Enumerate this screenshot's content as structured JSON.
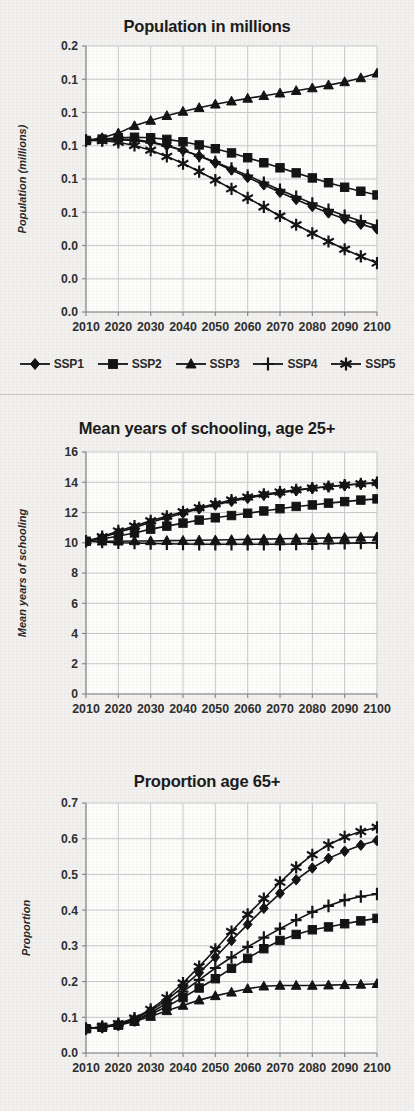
{
  "figure": {
    "divider_count": 2
  },
  "legend": {
    "items": [
      {
        "label": "SSP1",
        "marker": "diamond"
      },
      {
        "label": "SSP2",
        "marker": "square"
      },
      {
        "label": "SSP3",
        "marker": "triangle"
      },
      {
        "label": "SSP4",
        "marker": "plus"
      },
      {
        "label": "SSP5",
        "marker": "asterisk"
      }
    ]
  },
  "chart_data": [
    {
      "id": "population",
      "type": "line",
      "title": "Population in millions",
      "xlabel": "",
      "ylabel": "Population (millions)",
      "x": [
        2010,
        2015,
        2020,
        2025,
        2030,
        2035,
        2040,
        2045,
        2050,
        2055,
        2060,
        2065,
        2070,
        2075,
        2080,
        2085,
        2090,
        2095,
        2100
      ],
      "xtick_labels": [
        "2010",
        "2020",
        "2030",
        "2040",
        "2050",
        "2060",
        "2070",
        "2080",
        "2090",
        "2100"
      ],
      "xlim": [
        2010,
        2100
      ],
      "ytick_labels": [
        "0.2",
        "0.1",
        "0.1",
        "0.1",
        "0.1",
        "0.1",
        "0.0",
        "0.0",
        "0.0"
      ],
      "ytick_values": [
        0.2,
        0.175,
        0.15,
        0.125,
        0.1,
        0.075,
        0.05,
        0.025,
        0.0
      ],
      "ylim": [
        0.0,
        0.2
      ],
      "grid": true,
      "legend_position": "below",
      "series": [
        {
          "name": "SSP1",
          "marker": "diamond",
          "values": [
            0.129,
            0.1296,
            0.13,
            0.1297,
            0.128,
            0.1252,
            0.1216,
            0.1172,
            0.1122,
            0.1068,
            0.1012,
            0.0956,
            0.09,
            0.0846,
            0.0794,
            0.0745,
            0.07,
            0.066,
            0.0625
          ]
        },
        {
          "name": "SSP2",
          "marker": "square",
          "values": [
            0.129,
            0.13,
            0.131,
            0.1314,
            0.131,
            0.1298,
            0.128,
            0.1256,
            0.1228,
            0.1196,
            0.116,
            0.1122,
            0.1084,
            0.1046,
            0.1008,
            0.0972,
            0.0938,
            0.0908,
            0.088
          ]
        },
        {
          "name": "SSP3",
          "marker": "triangle",
          "values": [
            0.129,
            0.131,
            0.1345,
            0.14,
            0.144,
            0.1476,
            0.1508,
            0.1536,
            0.1562,
            0.1585,
            0.1606,
            0.1626,
            0.1645,
            0.1664,
            0.1684,
            0.1706,
            0.173,
            0.176,
            0.1795
          ]
        },
        {
          "name": "SSP4",
          "marker": "plus",
          "values": [
            0.129,
            0.1294,
            0.1296,
            0.129,
            0.1274,
            0.1248,
            0.1214,
            0.1174,
            0.1128,
            0.1078,
            0.1026,
            0.0972,
            0.0918,
            0.0866,
            0.0816,
            0.0768,
            0.0724,
            0.0684,
            0.0648
          ]
        },
        {
          "name": "SSP5",
          "marker": "asterisk",
          "values": [
            0.129,
            0.1288,
            0.1276,
            0.1252,
            0.1216,
            0.117,
            0.1116,
            0.1056,
            0.0992,
            0.0926,
            0.0858,
            0.079,
            0.0722,
            0.0656,
            0.0592,
            0.053,
            0.0472,
            0.0418,
            0.0368
          ]
        }
      ]
    },
    {
      "id": "schooling",
      "type": "line",
      "title": "Mean years of schooling, age 25+",
      "xlabel": "",
      "ylabel": "Mean years of schooling",
      "x": [
        2010,
        2015,
        2020,
        2025,
        2030,
        2035,
        2040,
        2045,
        2050,
        2055,
        2060,
        2065,
        2070,
        2075,
        2080,
        2085,
        2090,
        2095,
        2100
      ],
      "xtick_labels": [
        "2010",
        "2020",
        "2030",
        "2040",
        "2050",
        "2060",
        "2070",
        "2080",
        "2090",
        "2100"
      ],
      "xlim": [
        2010,
        2100
      ],
      "ytick_labels": [
        "16",
        "14",
        "12",
        "10",
        "8",
        "6",
        "4",
        "2",
        "0"
      ],
      "ytick_values": [
        16,
        14,
        12,
        10,
        8,
        6,
        4,
        2,
        0
      ],
      "ylim": [
        0,
        16
      ],
      "grid": true,
      "legend_position": "none",
      "series": [
        {
          "name": "SSP1",
          "marker": "diamond",
          "values": [
            10.1,
            10.35,
            10.7,
            11.0,
            11.35,
            11.65,
            11.95,
            12.25,
            12.5,
            12.75,
            12.95,
            13.15,
            13.3,
            13.45,
            13.6,
            13.7,
            13.8,
            13.88,
            13.95
          ]
        },
        {
          "name": "SSP2",
          "marker": "square",
          "values": [
            10.1,
            10.25,
            10.45,
            10.65,
            10.9,
            11.1,
            11.3,
            11.5,
            11.65,
            11.8,
            11.95,
            12.1,
            12.25,
            12.4,
            12.5,
            12.62,
            12.72,
            12.82,
            12.9
          ]
        },
        {
          "name": "SSP3",
          "marker": "triangle",
          "values": [
            10.1,
            10.1,
            10.1,
            10.12,
            10.12,
            10.14,
            10.15,
            10.17,
            10.18,
            10.2,
            10.22,
            10.24,
            10.26,
            10.28,
            10.3,
            10.32,
            10.34,
            10.36,
            10.38
          ]
        },
        {
          "name": "SSP4",
          "marker": "plus",
          "values": [
            10.1,
            10.05,
            10.0,
            9.98,
            9.95,
            9.93,
            9.92,
            9.9,
            9.9,
            9.9,
            9.9,
            9.9,
            9.9,
            9.92,
            9.93,
            9.95,
            9.97,
            9.99,
            10.0
          ]
        },
        {
          "name": "SSP5",
          "marker": "asterisk",
          "values": [
            10.1,
            10.4,
            10.78,
            11.1,
            11.45,
            11.75,
            12.05,
            12.32,
            12.58,
            12.82,
            13.02,
            13.2,
            13.35,
            13.5,
            13.62,
            13.72,
            13.82,
            13.9,
            13.98
          ]
        }
      ]
    },
    {
      "id": "proportion",
      "type": "line",
      "title": "Proportion age 65+",
      "xlabel": "",
      "ylabel": "Proportion",
      "x": [
        2010,
        2015,
        2020,
        2025,
        2030,
        2035,
        2040,
        2045,
        2050,
        2055,
        2060,
        2065,
        2070,
        2075,
        2080,
        2085,
        2090,
        2095,
        2100
      ],
      "xtick_labels": [
        "2010",
        "2020",
        "2030",
        "2040",
        "2050",
        "2060",
        "2070",
        "2080",
        "2090",
        "2100"
      ],
      "xlim": [
        2010,
        2100
      ],
      "ytick_labels": [
        "0.7",
        "0.6",
        "0.5",
        "0.4",
        "0.3",
        "0.2",
        "0.1",
        "0.0"
      ],
      "ytick_values": [
        0.7,
        0.6,
        0.5,
        0.4,
        0.3,
        0.2,
        0.1,
        0.0
      ],
      "ylim": [
        0.0,
        0.7
      ],
      "grid": true,
      "legend_position": "none",
      "series": [
        {
          "name": "SSP1",
          "marker": "diamond",
          "values": [
            0.068,
            0.072,
            0.08,
            0.095,
            0.118,
            0.148,
            0.185,
            0.225,
            0.268,
            0.315,
            0.36,
            0.405,
            0.447,
            0.485,
            0.518,
            0.545,
            0.565,
            0.582,
            0.595
          ]
        },
        {
          "name": "SSP2",
          "marker": "square",
          "values": [
            0.068,
            0.072,
            0.078,
            0.09,
            0.108,
            0.13,
            0.155,
            0.182,
            0.208,
            0.237,
            0.265,
            0.292,
            0.315,
            0.332,
            0.345,
            0.353,
            0.362,
            0.37,
            0.377
          ]
        },
        {
          "name": "SSP3",
          "marker": "triangle",
          "values": [
            0.068,
            0.072,
            0.078,
            0.088,
            0.102,
            0.118,
            0.133,
            0.148,
            0.16,
            0.17,
            0.18,
            0.187,
            0.189,
            0.189,
            0.189,
            0.19,
            0.191,
            0.192,
            0.194
          ]
        },
        {
          "name": "SSP4",
          "marker": "plus",
          "values": [
            0.068,
            0.073,
            0.08,
            0.092,
            0.112,
            0.14,
            0.172,
            0.205,
            0.238,
            0.268,
            0.297,
            0.323,
            0.348,
            0.372,
            0.395,
            0.412,
            0.428,
            0.438,
            0.445
          ]
        },
        {
          "name": "SSP5",
          "marker": "asterisk",
          "values": [
            0.068,
            0.074,
            0.082,
            0.098,
            0.122,
            0.155,
            0.196,
            0.242,
            0.29,
            0.34,
            0.388,
            0.432,
            0.478,
            0.52,
            0.555,
            0.583,
            0.605,
            0.62,
            0.632
          ]
        }
      ]
    }
  ]
}
